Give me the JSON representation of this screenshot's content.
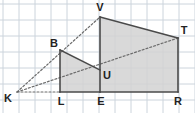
{
  "figure": {
    "canvas": {
      "width": 195,
      "height": 113
    },
    "grid": {
      "visible": true,
      "cell_size": 16,
      "origin_x": 3,
      "origin_y": 4,
      "color": "#ccd4dc",
      "line_width": 1
    },
    "style": {
      "fill_color": "#d2d2d2",
      "fill_opacity": "0.85",
      "solid_stroke": "#4a4a4a",
      "dashed_stroke": "#6b6b6b",
      "solid_width": 1.6,
      "dashed_width": 1.2,
      "dash_pattern": "2,2",
      "label_color": "#222222",
      "label_size": 11
    },
    "points": [
      {
        "name": "K",
        "x": 17,
        "y": 92,
        "label": "K",
        "label_x": 8,
        "label_y": 99
      },
      {
        "name": "L",
        "x": 60,
        "y": 92,
        "label": "L",
        "label_x": 61,
        "label_y": 102
      },
      {
        "name": "E",
        "x": 100,
        "y": 92,
        "label": "E",
        "label_x": 101,
        "label_y": 102
      },
      {
        "name": "R",
        "x": 178,
        "y": 92,
        "label": "R",
        "label_x": 178,
        "label_y": 102
      },
      {
        "name": "B",
        "x": 60,
        "y": 50,
        "label": "B",
        "label_x": 54,
        "label_y": 44
      },
      {
        "name": "U",
        "x": 100,
        "y": 70,
        "label": "U",
        "label_x": 107,
        "label_y": 76
      },
      {
        "name": "V",
        "x": 100,
        "y": 17,
        "label": "V",
        "label_x": 100,
        "label_y": 8
      },
      {
        "name": "T",
        "x": 178,
        "y": 38,
        "label": "T",
        "label_x": 184,
        "label_y": 31
      }
    ],
    "filled_regions": [
      {
        "name": "quad-BLEU",
        "vertices": "B,L,E,U"
      },
      {
        "name": "quad-VERT",
        "vertices": "V,E,R,T"
      }
    ],
    "solid_edges": [
      {
        "name": "edge-BL",
        "from": "B",
        "to": "L"
      },
      {
        "name": "edge-LE",
        "from": "L",
        "to": "E"
      },
      {
        "name": "edge-BU",
        "from": "B",
        "to": "U"
      },
      {
        "name": "edge-VE",
        "from": "V",
        "to": "E"
      },
      {
        "name": "edge-ER",
        "from": "E",
        "to": "R"
      },
      {
        "name": "edge-RT",
        "from": "R",
        "to": "T"
      },
      {
        "name": "edge-VT",
        "from": "V",
        "to": "T"
      }
    ],
    "dashed_edges": [
      {
        "name": "edge-KV",
        "from": "K",
        "to": "V"
      },
      {
        "name": "edge-KT",
        "from": "K",
        "to": "T"
      },
      {
        "name": "edge-KL",
        "from": "K",
        "to": "L"
      }
    ],
    "labels_order": [
      "V",
      "B",
      "T",
      "U",
      "K",
      "L",
      "E",
      "R"
    ]
  }
}
